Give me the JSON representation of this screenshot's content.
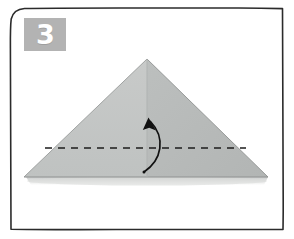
{
  "figure": {
    "kind": "origami-instruction-step",
    "step_number": "3",
    "badge": {
      "label": "3",
      "background_color": "#b3b3b3",
      "text_color": "#ffffff"
    },
    "frame": {
      "style": "hand-drawn-rounded-rectangle",
      "stroke_color": "#2b2b2b",
      "fill_color": "#ffffff"
    },
    "paper": {
      "shape": "triangle",
      "apex": {
        "x": 147,
        "y": 59
      },
      "bottom_left": {
        "x": 24,
        "y": 177
      },
      "bottom_right": {
        "x": 268,
        "y": 177
      },
      "fill_left": "#c3c5c4",
      "fill_right": "#b9bcbb",
      "edge_color": "#9a9d9c",
      "center_crease_color": "#aeb1b0",
      "shadow_color": "#c9cbca"
    },
    "fold_line": {
      "type": "valley-fold-dashed",
      "color": "#1d1d1d",
      "start": {
        "x": 45,
        "y": 148
      },
      "end": {
        "x": 246,
        "y": 148
      },
      "dash_pattern": "7 6"
    },
    "fold_arrow": {
      "type": "curved-fold-arrow",
      "direction": "up",
      "color": "#111111",
      "tail": {
        "x": 144,
        "y": 172
      },
      "head": {
        "x": 150,
        "y": 119
      }
    }
  }
}
